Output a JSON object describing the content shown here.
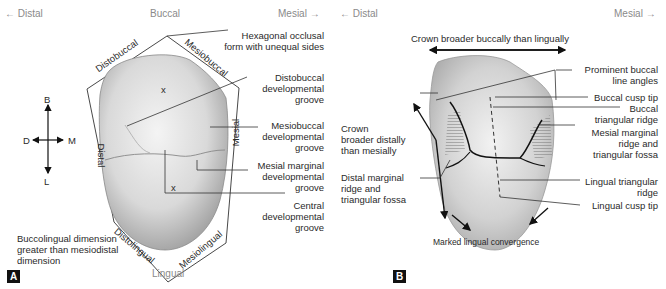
{
  "panel_a": {
    "badge": "A",
    "directions": {
      "left": "← Distal",
      "top": "Buccal",
      "right": "Mesial →",
      "bottom": "Lingual"
    },
    "compass": {
      "up": "B",
      "down": "L",
      "left": "D",
      "right": "M"
    },
    "side_labels": {
      "distobuccal": "Distobuccal",
      "mesiobuccal": "Mesiobuccal",
      "distal": "Distal",
      "mesial": "Mesial",
      "distolingual": "Distolingual",
      "mesiolingual": "Mesiolingual"
    },
    "cusp_mark": "x",
    "callouts": {
      "hexagonal": [
        "Hexagonal occlusal",
        "form with unequal sides"
      ],
      "distobuccal_groove": [
        "Distobuccal",
        "developmental",
        "groove"
      ],
      "mesiobuccal_groove": [
        "Mesiobuccal",
        "developmental",
        "groove"
      ],
      "mesial_marginal_groove": [
        "Mesial marginal",
        "developmental",
        "groove"
      ],
      "central_groove": [
        "Central",
        "developmental",
        "groove"
      ],
      "dimension_note": [
        "Buccolingual dimension",
        "greater than mesiodistal",
        "dimension"
      ]
    }
  },
  "panel_b": {
    "badge": "B",
    "directions": {
      "left": "← Distal",
      "right": "Mesial →"
    },
    "callouts": {
      "crown_broader_buccally": "Crown broader buccally than lingually",
      "prominent_line_angles": [
        "Prominent buccal",
        "line angles"
      ],
      "buccal_cusp_tip": "Buccal cusp tip",
      "buccal_triangular_ridge": [
        "Buccal",
        "triangular ridge"
      ],
      "mesial_marginal_ridge": [
        "Mesial marginal",
        "ridge and",
        "triangular fossa"
      ],
      "crown_broader_distally": [
        "Crown",
        "broader distally",
        "than mesially"
      ],
      "distal_marginal_ridge": [
        "Distal marginal",
        "ridge and",
        "triangular fossa"
      ],
      "lingual_triangular_ridge": [
        "Lingual triangular",
        "ridge"
      ],
      "lingual_cusp_tip": "Lingual cusp tip",
      "marked_lingual_convergence": "Marked lingual convergence"
    }
  }
}
